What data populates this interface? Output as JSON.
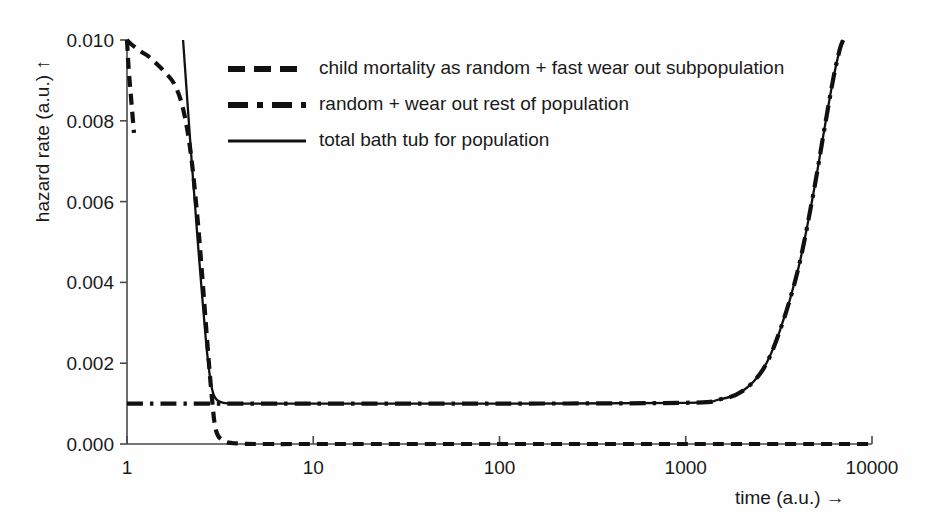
{
  "chart_data": {
    "type": "line",
    "title": "",
    "xlabel": "time (a.u.)  →",
    "ylabel": "hazard rate (a.u.)  ↑",
    "xscale": "log",
    "xlim": [
      1,
      10000
    ],
    "ylim": [
      0.0,
      0.01
    ],
    "xticks": [
      1,
      10,
      100,
      1000,
      10000
    ],
    "xtick_labels": [
      "1",
      "10",
      "100",
      "1000",
      "10000"
    ],
    "yticks": [
      0.0,
      0.002,
      0.004,
      0.006,
      0.008,
      0.01
    ],
    "ytick_labels": [
      "0.000",
      "0.002",
      "0.004",
      "0.006",
      "0.008",
      "0.010"
    ],
    "grid": false,
    "legend_position": "upper-left-inside",
    "series": [
      {
        "name": "child mortality as random + fast wear out subpopulation",
        "style": "dashed",
        "color": "#111111",
        "x": [
          1.0,
          1.05,
          1.12,
          1.2,
          1.3,
          1.45,
          1.6,
          1.8,
          2.0,
          2.2,
          2.4,
          2.55,
          2.7,
          2.85,
          3.0,
          3.3,
          4.0,
          6.0,
          10,
          100,
          1000,
          10000
        ],
        "y": [
          0.01,
          0.0099,
          0.0098,
          0.0097,
          0.0096,
          0.0094,
          0.0092,
          0.0089,
          0.0083,
          0.0072,
          0.0055,
          0.004,
          0.0025,
          0.0012,
          0.00035,
          8e-05,
          1e-05,
          0.0,
          0.0,
          0.0,
          0.0,
          0.0
        ]
      },
      {
        "name": "random + wear out rest of population",
        "style": "dash-dot",
        "color": "#111111",
        "x": [
          1,
          10,
          100,
          1000,
          1500,
          2000,
          2600,
          3200,
          4000,
          4800,
          5600,
          6200,
          6700,
          7000
        ],
        "y": [
          0.001,
          0.001,
          0.001,
          0.00102,
          0.0011,
          0.0013,
          0.00185,
          0.0028,
          0.0043,
          0.0061,
          0.0079,
          0.00905,
          0.00975,
          0.01
        ]
      },
      {
        "name": "total bath tub for population",
        "style": "solid",
        "color": "#111111",
        "x": [
          2.0,
          2.2,
          2.4,
          2.55,
          2.7,
          2.85,
          3.0,
          3.3,
          4.0,
          6.0,
          10,
          100,
          1000,
          1500,
          2000,
          2600,
          3200,
          4000,
          4800,
          5600,
          6200,
          6700,
          7000
        ],
        "y": [
          0.01,
          0.0073,
          0.005,
          0.0035,
          0.0022,
          0.0014,
          0.00112,
          0.00102,
          0.001,
          0.001,
          0.001,
          0.001,
          0.00102,
          0.0011,
          0.0013,
          0.00185,
          0.0028,
          0.0043,
          0.0061,
          0.0079,
          0.00905,
          0.00975,
          0.01
        ]
      },
      {
        "name": "child mortality upper tail at left axis",
        "style": "dashed",
        "color": "#111111",
        "x": [
          1.0,
          1.02,
          1.05,
          1.09
        ],
        "y": [
          0.01,
          0.0093,
          0.0086,
          0.0077
        ]
      }
    ]
  },
  "legend": {
    "items": [
      {
        "label": "child mortality as random + fast wear out subpopulation",
        "style": "dashed"
      },
      {
        "label": "random + wear out rest of population",
        "style": "dash-dot"
      },
      {
        "label": "total bath tub for population",
        "style": "solid"
      }
    ]
  },
  "colors": {
    "ink": "#111111",
    "axis": "#4a4a4a",
    "background": "#fefefe"
  }
}
